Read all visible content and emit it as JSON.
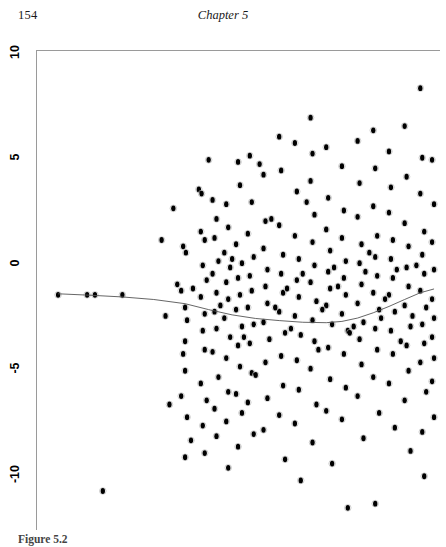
{
  "page": {
    "folio": "154",
    "chapter_title": "Chapter 5",
    "background_color": "#ffffff",
    "ink_color": "#000000"
  },
  "figure": {
    "caption_label": "Figure 5.2",
    "caption_text": "",
    "axis_color": "#9a9a9a",
    "point_color": "#000000",
    "curve_color": "#555555"
  },
  "chart_data": {
    "type": "scatter",
    "title": "",
    "subtitle": "",
    "xlabel": "",
    "ylabel": "",
    "grid": false,
    "legend": "none",
    "xlim": [
      0,
      100
    ],
    "ylim": [
      -12,
      10
    ],
    "yticks": [
      10,
      5,
      0,
      -5,
      -10
    ],
    "ytick_labels": [
      "10",
      "5",
      "0",
      "-5",
      "-10"
    ],
    "xticks": [],
    "xtick_labels": [],
    "x_axis_visible": false,
    "marker": "filled-circle",
    "n_points": 232,
    "points": [
      [
        3.6,
        -0.4
      ],
      [
        11.0,
        -0.4
      ],
      [
        13.0,
        -0.4
      ],
      [
        20.0,
        -0.4
      ],
      [
        15.0,
        -9.7
      ],
      [
        33.0,
        3.7
      ],
      [
        35.5,
        1.9
      ],
      [
        36.2,
        1.6
      ],
      [
        34.0,
        0.1
      ],
      [
        35.0,
        -0.2
      ],
      [
        36.0,
        -1.0
      ],
      [
        36.5,
        -1.6
      ],
      [
        36.0,
        -2.6
      ],
      [
        35.5,
        -3.2
      ],
      [
        36.0,
        -4.0
      ],
      [
        35.0,
        -5.2
      ],
      [
        36.5,
        -6.2
      ],
      [
        37.5,
        -7.3
      ],
      [
        36.0,
        -8.1
      ],
      [
        39.5,
        4.6
      ],
      [
        40.2,
        4.4
      ],
      [
        40.0,
        2.6
      ],
      [
        41.0,
        2.2
      ],
      [
        40.5,
        1.0
      ],
      [
        41.5,
        0.3
      ],
      [
        40.0,
        -0.5
      ],
      [
        41.0,
        -1.3
      ],
      [
        40.5,
        -2.1
      ],
      [
        41.0,
        -3.0
      ],
      [
        40.0,
        -4.6
      ],
      [
        41.5,
        -5.4
      ],
      [
        40.5,
        -6.6
      ],
      [
        41.0,
        -7.9
      ],
      [
        43.0,
        4.1
      ],
      [
        44.0,
        3.2
      ],
      [
        43.5,
        2.3
      ],
      [
        44.5,
        1.2
      ],
      [
        43.0,
        0.6
      ],
      [
        44.0,
        -0.3
      ],
      [
        43.5,
        -1.2
      ],
      [
        44.0,
        -2.0
      ],
      [
        43.0,
        -3.1
      ],
      [
        44.5,
        -4.3
      ],
      [
        43.5,
        -5.8
      ],
      [
        44.0,
        -7.1
      ],
      [
        46.5,
        3.9
      ],
      [
        47.0,
        2.8
      ],
      [
        46.0,
        1.6
      ],
      [
        47.5,
        0.9
      ],
      [
        46.5,
        0.2
      ],
      [
        47.0,
        -0.6
      ],
      [
        46.0,
        -1.5
      ],
      [
        47.5,
        -2.4
      ],
      [
        46.5,
        -3.4
      ],
      [
        47.0,
        -5.0
      ],
      [
        46.5,
        -6.4
      ],
      [
        47.0,
        -8.6
      ],
      [
        49.5,
        5.9
      ],
      [
        50.0,
        4.8
      ],
      [
        49.0,
        2.0
      ],
      [
        50.5,
        1.1
      ],
      [
        49.5,
        0.4
      ],
      [
        50.0,
        -0.4
      ],
      [
        49.0,
        -1.1
      ],
      [
        50.5,
        -1.9
      ],
      [
        49.5,
        -2.8
      ],
      [
        50.0,
        -3.8
      ],
      [
        49.0,
        -5.1
      ],
      [
        50.5,
        -6.0
      ],
      [
        49.5,
        -7.6
      ],
      [
        52.5,
        6.2
      ],
      [
        53.0,
        4.0
      ],
      [
        52.0,
        2.5
      ],
      [
        53.5,
        1.4
      ],
      [
        52.5,
        0.5
      ],
      [
        53.0,
        -0.2
      ],
      [
        52.0,
        -1.0
      ],
      [
        53.5,
        -1.8
      ],
      [
        52.5,
        -2.7
      ],
      [
        53.0,
        -4.1
      ],
      [
        52.0,
        -5.5
      ],
      [
        53.5,
        -7.0
      ],
      [
        56.0,
        5.3
      ],
      [
        56.5,
        3.1
      ],
      [
        56.0,
        1.8
      ],
      [
        57.0,
        0.8
      ],
      [
        56.5,
        0.0
      ],
      [
        57.0,
        -0.8
      ],
      [
        56.0,
        -1.7
      ],
      [
        57.5,
        -2.5
      ],
      [
        56.5,
        -3.6
      ],
      [
        57.0,
        -5.3
      ],
      [
        56.0,
        -6.8
      ],
      [
        60.0,
        7.1
      ],
      [
        60.5,
        5.5
      ],
      [
        60.0,
        2.9
      ],
      [
        61.0,
        1.5
      ],
      [
        60.5,
        0.6
      ],
      [
        61.0,
        -0.3
      ],
      [
        60.0,
        -1.2
      ],
      [
        61.5,
        -2.2
      ],
      [
        60.5,
        -3.3
      ],
      [
        61.0,
        -4.7
      ],
      [
        60.0,
        -6.1
      ],
      [
        61.5,
        -8.2
      ],
      [
        64.0,
        6.8
      ],
      [
        64.5,
        4.5
      ],
      [
        64.0,
        2.4
      ],
      [
        65.0,
        1.3
      ],
      [
        64.5,
        0.3
      ],
      [
        65.0,
        -0.5
      ],
      [
        64.0,
        -1.4
      ],
      [
        65.5,
        -2.3
      ],
      [
        64.5,
        -3.5
      ],
      [
        65.0,
        -4.9
      ],
      [
        64.0,
        -6.5
      ],
      [
        65.5,
        -9.2
      ],
      [
        68.0,
        8.0
      ],
      [
        68.5,
        6.3
      ],
      [
        68.0,
        5.0
      ],
      [
        69.0,
        3.4
      ],
      [
        68.5,
        2.1
      ],
      [
        69.0,
        1.0
      ],
      [
        68.0,
        0.2
      ],
      [
        69.5,
        -0.7
      ],
      [
        68.5,
        -1.6
      ],
      [
        69.0,
        -2.6
      ],
      [
        68.0,
        -3.9
      ],
      [
        69.5,
        -5.6
      ],
      [
        68.5,
        -7.4
      ],
      [
        72.0,
        6.6
      ],
      [
        72.5,
        4.2
      ],
      [
        72.0,
        2.7
      ],
      [
        73.0,
        1.7
      ],
      [
        72.5,
        0.7
      ],
      [
        73.0,
        -0.1
      ],
      [
        72.0,
        -0.9
      ],
      [
        73.5,
        -1.8
      ],
      [
        72.5,
        -2.9
      ],
      [
        73.0,
        -4.4
      ],
      [
        72.0,
        -5.9
      ],
      [
        73.5,
        -8.4
      ],
      [
        76.0,
        5.7
      ],
      [
        76.5,
        3.6
      ],
      [
        76.0,
        2.3
      ],
      [
        77.0,
        1.2
      ],
      [
        76.5,
        0.4
      ],
      [
        77.0,
        -0.4
      ],
      [
        76.0,
        -1.3
      ],
      [
        77.5,
        -2.1
      ],
      [
        76.5,
        -3.2
      ],
      [
        77.0,
        -4.8
      ],
      [
        76.0,
        -6.3
      ],
      [
        77.5,
        -10.5
      ],
      [
        80.0,
        6.9
      ],
      [
        80.5,
        4.9
      ],
      [
        80.0,
        3.3
      ],
      [
        81.0,
        2.0
      ],
      [
        80.5,
        1.1
      ],
      [
        81.0,
        0.1
      ],
      [
        80.0,
        -0.8
      ],
      [
        81.5,
        -1.7
      ],
      [
        80.5,
        -2.5
      ],
      [
        81.0,
        -3.7
      ],
      [
        80.0,
        -5.2
      ],
      [
        81.5,
        -7.2
      ],
      [
        84.0,
        7.4
      ],
      [
        84.5,
        5.6
      ],
      [
        84.0,
        3.8
      ],
      [
        85.0,
        2.4
      ],
      [
        84.5,
        1.4
      ],
      [
        85.0,
        0.5
      ],
      [
        84.0,
        -0.3
      ],
      [
        85.5,
        -1.1
      ],
      [
        84.5,
        -2.0
      ],
      [
        85.0,
        -3.0
      ],
      [
        84.0,
        -4.3
      ],
      [
        85.5,
        -6.0
      ],
      [
        84.5,
        -10.3
      ],
      [
        88.0,
        6.4
      ],
      [
        88.5,
        4.7
      ],
      [
        88.0,
        3.5
      ],
      [
        89.0,
        2.2
      ],
      [
        88.5,
        1.3
      ],
      [
        89.0,
        0.4
      ],
      [
        88.0,
        -0.4
      ],
      [
        89.5,
        -1.2
      ],
      [
        88.5,
        -2.1
      ],
      [
        89.0,
        -3.2
      ],
      [
        88.0,
        -4.6
      ],
      [
        89.5,
        -6.7
      ],
      [
        92.0,
        7.6
      ],
      [
        92.5,
        5.2
      ],
      [
        92.0,
        3.0
      ],
      [
        93.0,
        1.9
      ],
      [
        92.5,
        0.9
      ],
      [
        93.0,
        0.0
      ],
      [
        92.0,
        -0.9
      ],
      [
        93.5,
        -1.9
      ],
      [
        92.5,
        -2.8
      ],
      [
        93.0,
        -4.0
      ],
      [
        92.0,
        -5.4
      ],
      [
        93.5,
        -7.8
      ],
      [
        96.0,
        9.4
      ],
      [
        96.5,
        6.1
      ],
      [
        96.0,
        4.4
      ],
      [
        97.0,
        2.6
      ],
      [
        96.5,
        1.5
      ],
      [
        97.0,
        0.6
      ],
      [
        96.0,
        -0.2
      ],
      [
        97.5,
        -1.0
      ],
      [
        96.5,
        -1.8
      ],
      [
        97.0,
        -2.7
      ],
      [
        96.0,
        -3.6
      ],
      [
        97.5,
        -5.0
      ],
      [
        96.5,
        -6.9
      ],
      [
        97.0,
        -9.0
      ],
      [
        99.0,
        6.0
      ],
      [
        99.5,
        3.9
      ],
      [
        99.0,
        2.1
      ],
      [
        99.5,
        0.8
      ],
      [
        99.0,
        -0.6
      ],
      [
        99.5,
        -1.5
      ],
      [
        99.0,
        -2.4
      ],
      [
        99.5,
        -3.4
      ],
      [
        99.0,
        -4.5
      ],
      [
        99.5,
        -6.2
      ],
      [
        55.0,
        5.8
      ],
      [
        62.0,
        -0.1
      ],
      [
        66.0,
        0.6
      ],
      [
        70.0,
        -3.0
      ],
      [
        74.0,
        0.9
      ],
      [
        78.0,
        -2.2
      ],
      [
        82.0,
        0.7
      ],
      [
        86.0,
        -1.5
      ],
      [
        90.0,
        0.8
      ],
      [
        94.0,
        -1.4
      ],
      [
        30.0,
        2.2
      ],
      [
        31.0,
        -1.4
      ],
      [
        32.0,
        -5.6
      ],
      [
        38.0,
        -0.1
      ],
      [
        42.0,
        6.0
      ],
      [
        45.0,
        -0.9
      ],
      [
        48.0,
        1.3
      ],
      [
        51.0,
        -2.4
      ],
      [
        54.0,
        -4.2
      ],
      [
        58.0,
        3.2
      ],
      [
        59.0,
        -1.0
      ],
      [
        63.0,
        -2.0
      ],
      [
        67.0,
        4.0
      ],
      [
        71.0,
        -1.1
      ],
      [
        75.0,
        0.0
      ],
      [
        79.0,
        -1.9
      ],
      [
        83.0,
        1.6
      ],
      [
        87.0,
        -0.6
      ],
      [
        91.0,
        -2.6
      ],
      [
        95.0,
        1.0
      ]
    ],
    "smooth_curve": {
      "label": "lowess smooth",
      "color": "#555555",
      "points": [
        [
          3.6,
          -0.35
        ],
        [
          12.0,
          -0.42
        ],
        [
          20.0,
          -0.5
        ],
        [
          28.0,
          -0.62
        ],
        [
          36.0,
          -0.82
        ],
        [
          42.0,
          -1.1
        ],
        [
          48.0,
          -1.35
        ],
        [
          54.0,
          -1.52
        ],
        [
          60.0,
          -1.62
        ],
        [
          66.0,
          -1.7
        ],
        [
          72.0,
          -1.72
        ],
        [
          76.0,
          -1.66
        ],
        [
          80.0,
          -1.5
        ],
        [
          84.0,
          -1.25
        ],
        [
          88.0,
          -0.95
        ],
        [
          92.0,
          -0.62
        ],
        [
          96.0,
          -0.3
        ],
        [
          99.5,
          -0.12
        ]
      ]
    }
  }
}
